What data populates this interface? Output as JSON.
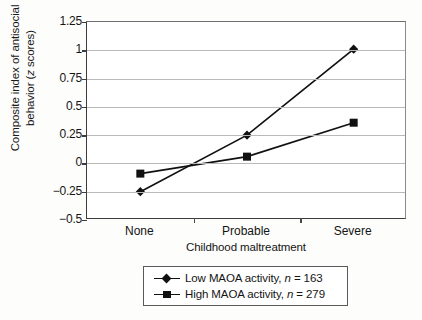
{
  "chart_data": {
    "type": "line",
    "title": "",
    "categories": [
      "None",
      "Probable",
      "Severe"
    ],
    "series": [
      {
        "name": "Low MAOA activity, n = 163",
        "marker": "diamond",
        "values": [
          -0.25,
          0.25,
          1.01
        ]
      },
      {
        "name": "High MAOA activity, n = 279",
        "marker": "square",
        "values": [
          -0.09,
          0.06,
          0.36
        ]
      }
    ],
    "xlabel": "Childhood maltreatment",
    "ylabel": "Composite index of antisocial behavior (z scores)",
    "ylabel_line1": "Composite index of antisocial",
    "ylabel_line2_pre": "behavior (",
    "ylabel_line2_ital": "z",
    "ylabel_line2_post": " scores)",
    "ylim": [
      -0.5,
      1.25
    ],
    "yticks": [
      1.25,
      1,
      0.75,
      0.5,
      0.25,
      0,
      -0.25,
      -0.5
    ],
    "ytick_labels": [
      "1.25",
      "1",
      "0.75",
      "0.5",
      "0.25",
      "0",
      "−0.25",
      "−0.5"
    ],
    "grid": true,
    "legend_position": "below-center",
    "colors": {
      "line": "#111111",
      "marker": "#111111",
      "grid": "#b9b9b9",
      "axis": "#3c3c3c",
      "background": "#ffffff"
    }
  },
  "legend": {
    "entries": [
      {
        "marker": "diamond-marker",
        "label_pre": "Low MAOA activity, ",
        "label_ital": "n",
        "label_post": " = 163"
      },
      {
        "marker": "square-marker",
        "label_pre": "High MAOA activity, ",
        "label_ital": "n",
        "label_post": " = 279"
      }
    ]
  }
}
